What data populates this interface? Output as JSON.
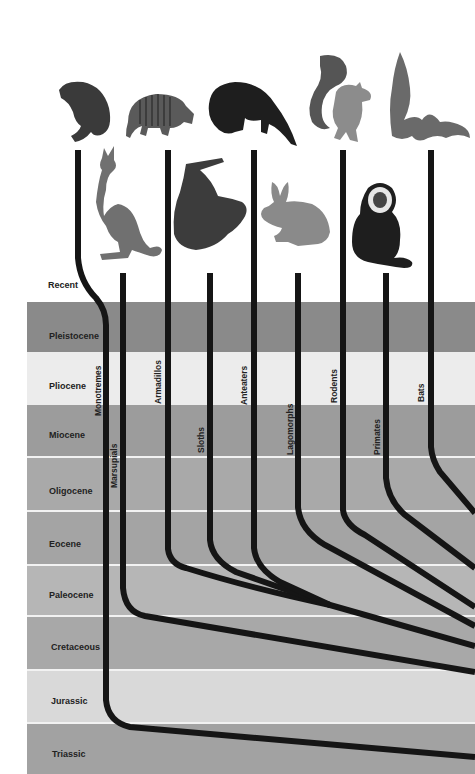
{
  "eras": [
    {
      "name": "Recent",
      "top": 274,
      "height": 28,
      "color": "#ffffff"
    },
    {
      "name": "Pleistocene",
      "top": 302,
      "height": 50,
      "color": "#8a8a8a"
    },
    {
      "name": "Pliocene",
      "top": 352,
      "height": 53,
      "color": "#ececec"
    },
    {
      "name": "Miocene",
      "top": 405,
      "height": 52,
      "color": "#9c9c9c"
    },
    {
      "name": "Oligocene",
      "top": 457,
      "height": 54,
      "color": "#a9a9a9"
    },
    {
      "name": "Eocene",
      "top": 511,
      "height": 54,
      "color": "#a4a4a4"
    },
    {
      "name": "Paleocene",
      "top": 565,
      "height": 51,
      "color": "#b6b6b6"
    },
    {
      "name": "Cretaceous",
      "top": 616,
      "height": 54,
      "color": "#a8a8a8"
    },
    {
      "name": "Jurassic",
      "top": 670,
      "height": 53,
      "color": "#d9d9d9"
    },
    {
      "name": "Triassic",
      "top": 723,
      "height": 51,
      "color": "#a2a2a2"
    }
  ],
  "groups": [
    {
      "name": "Monotremes",
      "animal": "platypus"
    },
    {
      "name": "Marsupials",
      "animal": "kangaroo"
    },
    {
      "name": "Armadillos",
      "animal": "armadillo"
    },
    {
      "name": "Sloths",
      "animal": "sloth"
    },
    {
      "name": "Anteaters",
      "animal": "anteater"
    },
    {
      "name": "Lagomorphs",
      "animal": "rabbit"
    },
    {
      "name": "Rodents",
      "animal": "squirrel"
    },
    {
      "name": "Primates",
      "animal": "monkey"
    },
    {
      "name": "Bats",
      "animal": "bat"
    }
  ],
  "colors": {
    "branch": "#151515",
    "separator": "#f2f2f2"
  }
}
